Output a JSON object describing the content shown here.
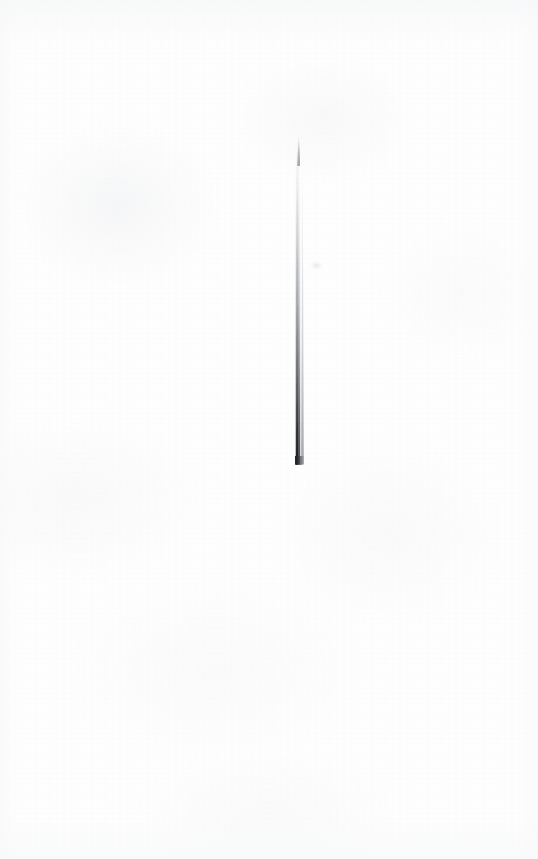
{
  "image": {
    "kind": "scanned-photograph",
    "subject": "needle",
    "orientation": "vertical",
    "background_color": "#fefefe",
    "alt_text": "A single long slender tapered needle photographed vertically against a plain near-white paper background.",
    "caption": "",
    "width_px": 538,
    "height_px": 859
  },
  "background": {
    "name": "paper",
    "base_color": "#fefefe",
    "mottle_color": "#edeef1",
    "grain_color": "#f3f4f6",
    "vignette_color": "#f7f8f9"
  },
  "object": {
    "name": "needle",
    "label": "",
    "shape": "tapered-shaft",
    "tip_position": "top",
    "butt_position": "bottom",
    "center_x_px": 301,
    "top_y_px": 138,
    "bottom_y_px": 464,
    "length_px": 326,
    "tip_width_px": 2,
    "butt_width_px": 9,
    "dark_edge_color": "#1a1c21",
    "mid_tone_color": "#6a6c72",
    "highlight_color": "#e0e2e6",
    "halo_color": "#c8cad0"
  },
  "marks": [
    {
      "name": "paper-smudge",
      "x_px": 310,
      "y_px": 261,
      "width_px": 13,
      "height_px": 9,
      "color": "#e0e2e6"
    }
  ]
}
